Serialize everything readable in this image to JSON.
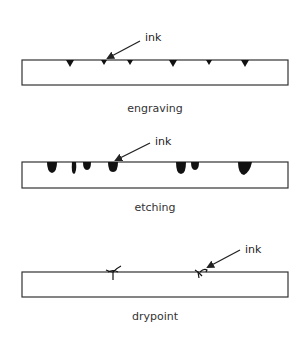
{
  "diagram": {
    "colors": {
      "line": "#333333",
      "ink": "#111111",
      "background": "#ffffff"
    },
    "panels": [
      {
        "id": "engraving",
        "caption": "engraving",
        "pointer_label": "ink",
        "plate": {
          "x": 22,
          "y": 60,
          "w": 266,
          "h": 25
        },
        "marks": [
          70,
          104,
          130,
          173,
          209,
          245
        ]
      },
      {
        "id": "etching",
        "caption": "etching",
        "pointer_label": "ink",
        "plate": {
          "x": 22,
          "y": 162,
          "w": 266,
          "h": 26
        },
        "marks": [
          52,
          74,
          87,
          113,
          181,
          195,
          244
        ]
      },
      {
        "id": "drypoint",
        "caption": "drypoint",
        "pointer_label": "ink",
        "plate": {
          "x": 22,
          "y": 272,
          "w": 266,
          "h": 25
        },
        "marks": [
          113,
          200
        ]
      }
    ]
  }
}
